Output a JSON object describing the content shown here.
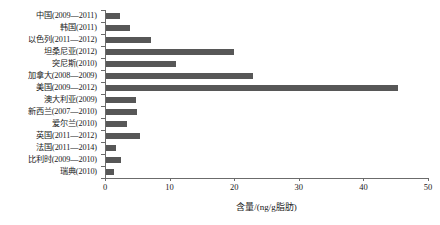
{
  "chart_data": {
    "type": "bar",
    "orientation": "horizontal",
    "title": "",
    "xlabel": "含量/(ng/g脂肪)",
    "ylabel": "",
    "xlim": [
      0,
      50
    ],
    "xticks": [
      0,
      10,
      20,
      30,
      40,
      50
    ],
    "grid": false,
    "legend": false,
    "bar_color": "#575757",
    "axis_color": "#6b6b6b",
    "categories": [
      "中国(2009—2011)",
      "韩国(2011)",
      "以色列(2011—2012)",
      "坦桑尼亚(2012)",
      "突尼斯(2010)",
      "加拿大(2008—2009)",
      "美国(2009—2012)",
      "澳大利亚(2009)",
      "新西兰(2007—2010)",
      "爱尔兰(2010)",
      "英国(2011—2012)",
      "法国(2011—2014)",
      "比利时(2009—2010)",
      "瑞典(2010)"
    ],
    "values": [
      2.1,
      3.7,
      7.0,
      19.8,
      10.8,
      22.8,
      45.2,
      4.6,
      4.8,
      3.3,
      5.3,
      1.6,
      2.3,
      1.2
    ]
  }
}
